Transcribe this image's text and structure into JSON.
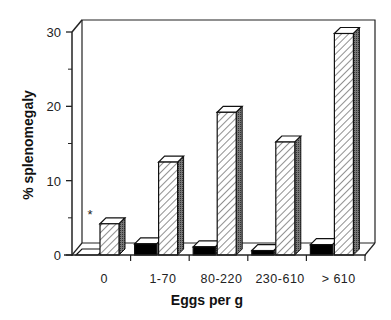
{
  "chart_data": {
    "type": "bar",
    "style": "3d-clustered",
    "title": "",
    "xlabel": "Eggs per g",
    "ylabel": "% splenomegaly",
    "ylim": [
      0,
      30
    ],
    "yticks": [
      0,
      10,
      20,
      30
    ],
    "categories": [
      "0",
      "1-70",
      "80-220",
      "230-610",
      "> 610"
    ],
    "series": [
      {
        "name": "series 1 (solid black)",
        "fill": "#000000",
        "values": [
          0,
          1.5,
          1.1,
          0.6,
          1.4
        ]
      },
      {
        "name": "series 2 (hatched)",
        "fill": "hatch",
        "values": [
          4.2,
          12.5,
          19.2,
          15.2,
          29.8
        ]
      }
    ],
    "annotations": [
      {
        "text": "*",
        "category": "0",
        "series": 0
      }
    ],
    "grid": false,
    "legend": null
  },
  "axis": {
    "y_title": "% splenomegaly",
    "x_title": "Eggs per g",
    "y_tick_labels": [
      "0",
      "10",
      "20",
      "30"
    ],
    "x_tick_labels": [
      "0",
      "1-70",
      "80-220",
      "230-610",
      "> 610"
    ],
    "annotation_star": "*"
  }
}
